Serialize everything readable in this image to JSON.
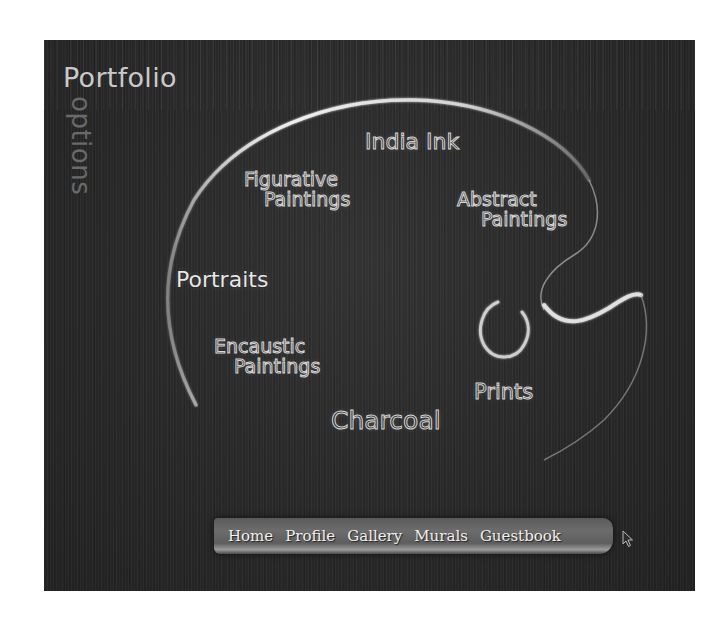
{
  "header": {
    "title": "Portfolio",
    "subtitle": "options"
  },
  "palette": {
    "categories": [
      {
        "id": "india-ink",
        "line1": "India Ink",
        "line2": ""
      },
      {
        "id": "figurative-paintings",
        "line1": "Figurative",
        "line2": "Paintings"
      },
      {
        "id": "abstract-paintings",
        "line1": "Abstract",
        "line2": "Paintings"
      },
      {
        "id": "portraits",
        "line1": "Portraits",
        "line2": ""
      },
      {
        "id": "encaustic-paintings",
        "line1": "Encaustic",
        "line2": "Paintings"
      },
      {
        "id": "prints",
        "line1": "Prints",
        "line2": ""
      },
      {
        "id": "charcoal",
        "line1": "Charcoal",
        "line2": ""
      }
    ]
  },
  "nav": {
    "items": [
      {
        "label": "Home"
      },
      {
        "label": "Profile"
      },
      {
        "label": "Gallery"
      },
      {
        "label": "Murals"
      },
      {
        "label": "Guestbook"
      }
    ]
  },
  "colors": {
    "background": "#2b2b2b",
    "page": "#ffffff",
    "text": "#dadada",
    "subtitle": "#6a6a6a"
  }
}
